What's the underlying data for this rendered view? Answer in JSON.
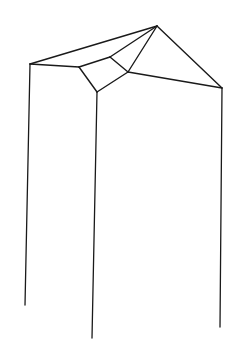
{
  "figure": {
    "kind": "geometric-line-drawing",
    "canvas": {
      "width": 247,
      "height": 353
    },
    "background_color": "#ffffff",
    "stroke_color": "#1a1a1a",
    "fill_color": "#ffffff",
    "stroke_width": 1.4,
    "leg_stroke_width": 1.3,
    "vertices": {
      "apex": {
        "name": "apex",
        "x": 157,
        "y": 26
      },
      "left_eave": {
        "name": "left-eave",
        "x": 30,
        "y": 64
      },
      "right_eave": {
        "name": "right-eave",
        "x": 222,
        "y": 88
      },
      "quad_left": {
        "name": "facet-left",
        "x": 79,
        "y": 67
      },
      "quad_top": {
        "name": "facet-top",
        "x": 110,
        "y": 57
      },
      "quad_right": {
        "name": "facet-right",
        "x": 128,
        "y": 72
      },
      "quad_bottom": {
        "name": "facet-bottom",
        "x": 97,
        "y": 92
      },
      "left_foot": {
        "name": "left-foot",
        "x": 25,
        "y": 305
      },
      "center_foot": {
        "name": "center-foot",
        "x": 92,
        "y": 338
      },
      "right_foot": {
        "name": "right-foot",
        "x": 220,
        "y": 327
      }
    },
    "facet_polygon": "79,67 110,57 128,72 97,92",
    "edges": [
      {
        "name": "apex-to-left-eave",
        "path": "M157,26 L30,64"
      },
      {
        "name": "apex-to-right-eave",
        "path": "M157,26 L222,88"
      },
      {
        "name": "apex-to-facet-top",
        "path": "M157,26 L110,57"
      },
      {
        "name": "apex-to-facet-right",
        "path": "M157,26 L128,72"
      },
      {
        "name": "left-eave-to-facet-left",
        "path": "M30,64 L79,67"
      },
      {
        "name": "facet-right-to-right-eave",
        "path": "M128,72 L222,88"
      },
      {
        "name": "facet-left-edge",
        "path": "M79,67 L110,57"
      },
      {
        "name": "facet-top-edge",
        "path": "M110,57 L128,72"
      },
      {
        "name": "facet-right-edge",
        "path": "M128,72 L97,92"
      },
      {
        "name": "facet-bottom-edge",
        "path": "M97,92 L79,67"
      }
    ],
    "legs": [
      {
        "name": "left-leg",
        "path": "M30,64 L25,305"
      },
      {
        "name": "center-leg",
        "path": "M97,92 L92,338"
      },
      {
        "name": "right-leg",
        "path": "M222,88 L220,327"
      }
    ]
  }
}
